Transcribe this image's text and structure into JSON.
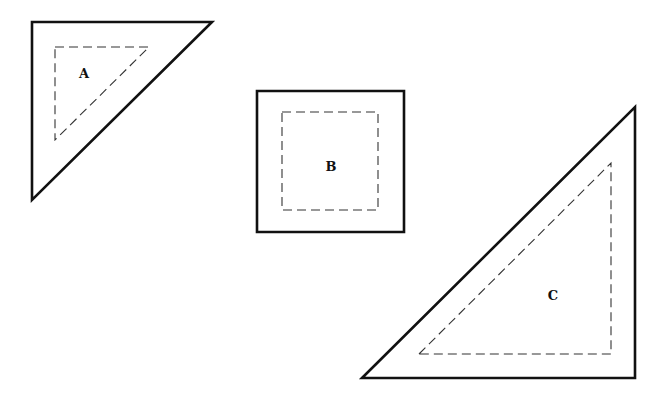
{
  "canvas": {
    "width": 666,
    "height": 395,
    "background": "#ffffff"
  },
  "shapes": [
    {
      "id": "A",
      "type": "right-triangle",
      "label": "A",
      "label_pos": [
        84,
        78
      ],
      "outer_points": "32,22 212,22 32,200",
      "inner_points": "55,47 149,47 55,140"
    },
    {
      "id": "B",
      "type": "square",
      "label": "B",
      "label_pos": [
        331,
        171
      ],
      "outer_points": "257,91 404,91 404,232 257,232",
      "inner_points": "282,112 378,112 378,210 282,210"
    },
    {
      "id": "C",
      "type": "right-triangle",
      "label": "C",
      "label_pos": [
        553,
        300
      ],
      "outer_points": "362,378 635,107 635,378",
      "inner_points": "419,354 611,163 611,354"
    }
  ],
  "style": {
    "stroke_color": "#111111",
    "dash_color": "#333333"
  }
}
